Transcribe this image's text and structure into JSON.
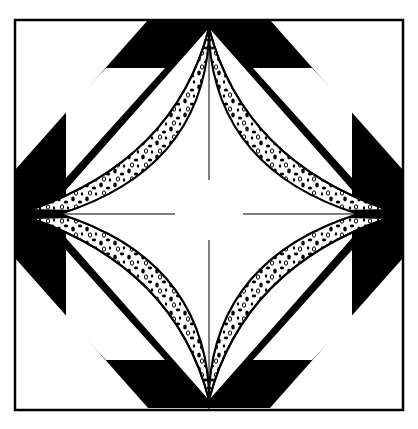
{
  "figure": {
    "colors": {
      "background": "#ffffff",
      "ink": "#000000"
    },
    "frame": {
      "x": 15,
      "y": 20,
      "width": 388,
      "height": 390
    },
    "center": {
      "x": 209,
      "y": 214
    },
    "quadrants": [
      "top-left",
      "top-right",
      "bottom-left",
      "bottom-right"
    ],
    "patterns": {
      "solid": "black",
      "speckled": "dotted-print",
      "plain": "white"
    }
  }
}
